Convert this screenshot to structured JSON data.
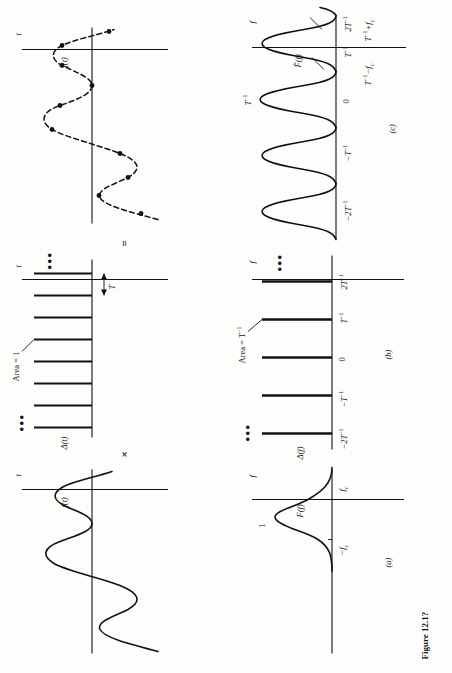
{
  "figure": {
    "caption": "Figure 12.1?",
    "operators": {
      "times": "×",
      "equals": "="
    }
  },
  "panels": {
    "top_row": [
      {
        "id": "time-signal",
        "ylabel": "f(t)",
        "xlabel": "t",
        "kind": "continuous-waveform"
      },
      {
        "id": "impulse-train-time",
        "ylabel": "Δ(t)",
        "xlabel": "t",
        "annotation": "Area = 1",
        "spacing_label": "T",
        "ellipsis": "•••",
        "kind": "impulse-train"
      },
      {
        "id": "sampled-signal",
        "ylabel": "f(t)",
        "xlabel": "t",
        "kind": "sampled-waveform"
      }
    ],
    "bottom_row": [
      {
        "id": "spectrum-f",
        "panel_letter": "(a)",
        "ylabel": "F(f)",
        "xlabel": "f",
        "peak_label": "1",
        "ticks": [
          "-f",
          "f"
        ],
        "tick_subs": [
          "c",
          "c"
        ],
        "kind": "spectrum"
      },
      {
        "id": "impulse-train-freq",
        "panel_letter": "(b)",
        "ylabel": "Δ(f)",
        "xlabel": "f",
        "annotation": "Area = T",
        "annotation_sup": "-1",
        "ticks": [
          "-2T",
          "-T",
          "0",
          "T",
          "2T"
        ],
        "tick_sups": [
          "-1",
          "-1",
          "",
          "-1",
          "-1"
        ],
        "ellipsis": "•••",
        "kind": "impulse-train"
      },
      {
        "id": "sampled-spectrum",
        "panel_letter": "(c)",
        "ylabel": "F̂(f)",
        "xlabel": "f",
        "peak_label": "T",
        "peak_label_sup": "-1",
        "ticks": [
          "-2T",
          "-T",
          "0",
          "T",
          "2T"
        ],
        "tick_sups": [
          "-1",
          "-1",
          "",
          "-1",
          "-1"
        ],
        "callout_left": "T  −f",
        "callout_left_sup": "-1",
        "callout_left_sub": "c",
        "callout_right": "T  +f",
        "callout_right_sup": "-1",
        "callout_right_sub": "c",
        "kind": "replicated-spectrum"
      }
    ]
  }
}
